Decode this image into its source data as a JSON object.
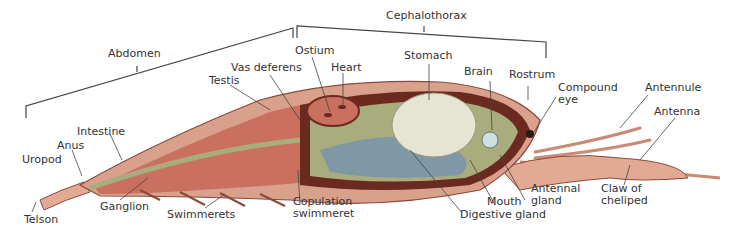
{
  "regions": {
    "abdomen": "Abdomen",
    "cephalothorax": "Cephalothorax"
  },
  "labels": {
    "ostium": "Ostium",
    "vas_deferens": "Vas deferens",
    "heart": "Heart",
    "testis": "Testis",
    "stomach": "Stomach",
    "brain": "Brain",
    "rostrum": "Rostrum",
    "compound_eye_1": "Compound",
    "compound_eye_2": "eye",
    "antennule": "Antennule",
    "antenna": "Antenna",
    "intestine": "Intestine",
    "anus": "Anus",
    "uropod": "Uropod",
    "telson": "Telson",
    "ganglion": "Ganglion",
    "swimmerets": "Swimmerets",
    "copulation_1": "Copulation",
    "copulation_2": "swimmeret",
    "digestive_gland": "Digestive gland",
    "mouth": "Mouth",
    "antennal_gland_1": "Antennal",
    "antennal_gland_2": "gland",
    "claw_1": "Claw of",
    "claw_2": "cheliped"
  },
  "colors": {
    "shell": "#d9a08c",
    "muscle": "#c9705e",
    "dark": "#6b2a20",
    "gut": "#a9ac7c",
    "gland": "#7f98a6",
    "stomach": "#e6e4d2",
    "line": "#444444"
  }
}
